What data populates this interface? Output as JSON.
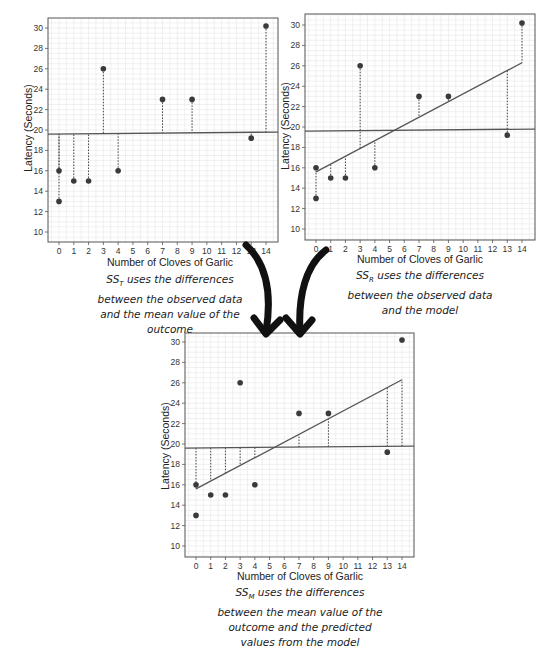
{
  "chart_data": [
    {
      "id": "ss_t",
      "type": "scatter",
      "title": "",
      "xlabel": "Number of Cloves of Garlic",
      "ylabel": "Latency (Seconds)",
      "xlim": [
        -0.7,
        14.7
      ],
      "ylim": [
        9,
        31
      ],
      "x_ticks": [
        0,
        1,
        2,
        3,
        4,
        5,
        6,
        7,
        8,
        9,
        10,
        11,
        12,
        13,
        14
      ],
      "y_ticks": [
        10,
        12,
        14,
        16,
        18,
        20,
        22,
        24,
        26,
        28,
        30
      ],
      "grid": true,
      "points": [
        [
          0,
          16
        ],
        [
          0,
          13
        ],
        [
          1,
          15
        ],
        [
          2,
          15
        ],
        [
          3,
          26
        ],
        [
          4,
          16
        ],
        [
          7,
          23
        ],
        [
          9,
          23
        ],
        [
          13,
          19.2
        ],
        [
          14,
          30.2
        ]
      ],
      "mean_line": {
        "y_start": 19.6,
        "y_end": 19.8
      },
      "regression_line": null,
      "residuals": "observed-to-mean",
      "caption_prefix": "SS",
      "caption_sub": "T",
      "caption": " uses the differences between the observed data and the mean value of the outcome"
    },
    {
      "id": "ss_r",
      "type": "scatter",
      "title": "",
      "xlabel": "Number of Cloves of Garlic",
      "ylabel": "Latency (Seconds)",
      "xlim": [
        -0.7,
        14.7
      ],
      "ylim": [
        9,
        31
      ],
      "x_ticks": [
        0,
        1,
        2,
        3,
        4,
        5,
        6,
        7,
        8,
        9,
        10,
        11,
        12,
        13,
        14
      ],
      "y_ticks": [
        10,
        12,
        14,
        16,
        18,
        20,
        22,
        24,
        26,
        28,
        30
      ],
      "grid": true,
      "points": [
        [
          0,
          16
        ],
        [
          0,
          13
        ],
        [
          1,
          15
        ],
        [
          2,
          15
        ],
        [
          3,
          26
        ],
        [
          4,
          16
        ],
        [
          7,
          23
        ],
        [
          9,
          23
        ],
        [
          13,
          19.2
        ],
        [
          14,
          30.2
        ]
      ],
      "mean_line": {
        "y_start": 19.6,
        "y_end": 19.8
      },
      "regression_line": {
        "x0": 0,
        "y0": 15.6,
        "x1": 14,
        "y1": 26.3
      },
      "residuals": "observed-to-model",
      "caption_prefix": "SS",
      "caption_sub": "R",
      "caption": " uses the differences between the observed data and the model"
    },
    {
      "id": "ss_m",
      "type": "scatter",
      "title": "",
      "xlabel": "Number of Cloves of Garlic",
      "ylabel": "Latency (Seconds)",
      "xlim": [
        -0.7,
        14.7
      ],
      "ylim": [
        9,
        31
      ],
      "x_ticks": [
        0,
        1,
        2,
        3,
        4,
        5,
        6,
        7,
        8,
        9,
        10,
        11,
        12,
        13,
        14
      ],
      "y_ticks": [
        10,
        12,
        14,
        16,
        18,
        20,
        22,
        24,
        26,
        28,
        30
      ],
      "grid": true,
      "points": [
        [
          0,
          16
        ],
        [
          0,
          13
        ],
        [
          1,
          15
        ],
        [
          2,
          15
        ],
        [
          3,
          26
        ],
        [
          4,
          16
        ],
        [
          7,
          23
        ],
        [
          9,
          23
        ],
        [
          13,
          19.2
        ],
        [
          14,
          30.2
        ]
      ],
      "mean_line": {
        "y_start": 19.6,
        "y_end": 19.8
      },
      "regression_line": {
        "x0": 0,
        "y0": 15.6,
        "x1": 14,
        "y1": 26.3
      },
      "residuals": "mean-to-model",
      "caption_prefix": "SS",
      "caption_sub": "M",
      "caption": " uses the differences between the mean value of the outcome and the predicted values from the model"
    }
  ],
  "captions": {
    "ss_t": {
      "prefix": "SS",
      "sub": "T",
      "lines": [
        " uses the differences",
        "between the observed data",
        "and the mean value of the",
        "outcome"
      ]
    },
    "ss_r": {
      "prefix": "SS",
      "sub": "R",
      "lines": [
        " uses the differences",
        "between the observed data",
        "and the model"
      ]
    },
    "ss_m": {
      "prefix": "SS",
      "sub": "M",
      "lines": [
        " uses the differences",
        "between the mean value of the",
        "outcome and the predicted",
        "values from the model"
      ]
    }
  },
  "axis": {
    "xlabel": "Number of Cloves of Garlic",
    "ylabel": "Latency (Seconds)"
  },
  "colors": {
    "point": "#3a3a3a",
    "line": "#555555",
    "grid": "#e6e6e6",
    "frame": "#555555",
    "arrow": "#111111"
  }
}
